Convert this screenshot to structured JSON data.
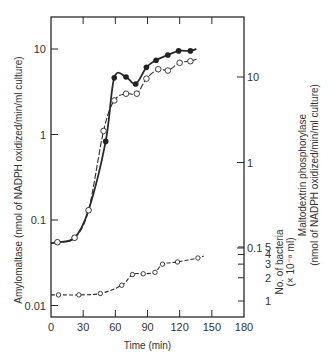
{
  "chart_data": {
    "type": "line",
    "title": "",
    "xlabel": "Time (min)",
    "ylabel_left": "Amylomaltase (nmol of NADPH oxidized/min/ml culture)",
    "ylabel_right": "Maltodextrin phosphorylase (nmol of NADPH oxidized/min/ml culture)",
    "ylabel_right_secondary": "No. of bacteria (x 10^-8 ml)",
    "xlim": [
      0,
      180
    ],
    "ylim_left": [
      0.007,
      20
    ],
    "yscale": "log",
    "grid": false,
    "x_ticks": [
      "0",
      "30",
      "60",
      "90",
      "120",
      "150",
      "180"
    ],
    "y_left_ticks": [
      "0.01",
      "0.1",
      "1",
      "10"
    ],
    "y_right_ticks": [
      "0.1",
      "1",
      "10"
    ],
    "bacteria_ticks": [
      "1",
      "2",
      "3",
      "4",
      "5"
    ],
    "series": [
      {
        "name": "Amylomaltase (filled circles, solid line)",
        "marker": "filled",
        "line": "solid",
        "x": [
          6,
          22,
          35,
          51,
          59,
          70,
          79,
          89,
          98,
          109,
          119,
          130
        ],
        "values": [
          0.055,
          0.062,
          0.13,
          0.83,
          4.6,
          4.7,
          3.9,
          6.1,
          7.4,
          8.5,
          9.5,
          9.5
        ]
      },
      {
        "name": "Maltodextrin phosphorylase (open circles, dashed line)",
        "marker": "open",
        "line": "dashed",
        "x": [
          6,
          22,
          35,
          49,
          59,
          70,
          80,
          89,
          100,
          109,
          120,
          130
        ],
        "values": [
          0.055,
          0.062,
          0.13,
          1.1,
          2.5,
          3.0,
          3.0,
          4.5,
          5.8,
          5.6,
          6.9,
          7.2
        ]
      },
      {
        "name": "No. of bacteria (small open circles, dashed line)",
        "marker": "open-small",
        "line": "dashed",
        "x": [
          7,
          26,
          46,
          66,
          76,
          86,
          97,
          104,
          118,
          137
        ],
        "values": [
          1.2,
          1.2,
          1.25,
          1.6,
          2.2,
          2.25,
          2.35,
          3.0,
          3.2,
          3.6
        ]
      }
    ]
  }
}
